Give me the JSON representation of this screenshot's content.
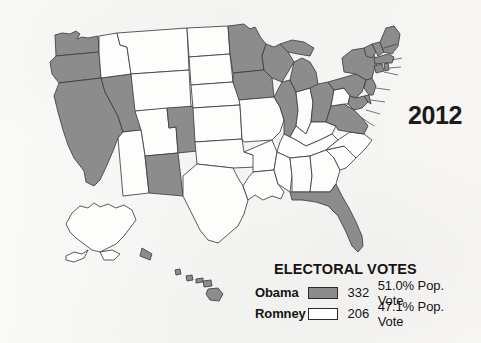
{
  "year_label": "2012",
  "legend": {
    "title": "ELECTORAL VOTES",
    "rows": [
      {
        "candidate": "Obama",
        "electoral_votes": "332",
        "popular_vote": "51.0% Pop. Vote",
        "swatch_color": "#8c8c8c"
      },
      {
        "candidate": "Romney",
        "electoral_votes": "206",
        "popular_vote": "47.1% Pop. Vote",
        "swatch_color": "#ffffff"
      }
    ]
  },
  "map": {
    "title": "2012 United States presidential election results by state",
    "colors": {
      "obama_fill": "#8c8c8c",
      "romney_fill": "#fdfdfc",
      "border": "#3d3d3d",
      "paper": "#f7f7f5"
    },
    "states": [
      {
        "code": "WA",
        "winner": "Obama"
      },
      {
        "code": "OR",
        "winner": "Obama"
      },
      {
        "code": "CA",
        "winner": "Obama"
      },
      {
        "code": "NV",
        "winner": "Obama"
      },
      {
        "code": "ID",
        "winner": "Romney"
      },
      {
        "code": "MT",
        "winner": "Romney"
      },
      {
        "code": "WY",
        "winner": "Romney"
      },
      {
        "code": "UT",
        "winner": "Romney"
      },
      {
        "code": "AZ",
        "winner": "Romney"
      },
      {
        "code": "CO",
        "winner": "Obama"
      },
      {
        "code": "NM",
        "winner": "Obama"
      },
      {
        "code": "ND",
        "winner": "Romney"
      },
      {
        "code": "SD",
        "winner": "Romney"
      },
      {
        "code": "NE",
        "winner": "Romney"
      },
      {
        "code": "KS",
        "winner": "Romney"
      },
      {
        "code": "OK",
        "winner": "Romney"
      },
      {
        "code": "TX",
        "winner": "Romney"
      },
      {
        "code": "MN",
        "winner": "Obama"
      },
      {
        "code": "IA",
        "winner": "Obama"
      },
      {
        "code": "MO",
        "winner": "Romney"
      },
      {
        "code": "AR",
        "winner": "Romney"
      },
      {
        "code": "LA",
        "winner": "Romney"
      },
      {
        "code": "WI",
        "winner": "Obama"
      },
      {
        "code": "IL",
        "winner": "Obama"
      },
      {
        "code": "MS",
        "winner": "Romney"
      },
      {
        "code": "AL",
        "winner": "Romney"
      },
      {
        "code": "TN",
        "winner": "Romney"
      },
      {
        "code": "KY",
        "winner": "Romney"
      },
      {
        "code": "IN",
        "winner": "Romney"
      },
      {
        "code": "MI",
        "winner": "Obama"
      },
      {
        "code": "OH",
        "winner": "Obama"
      },
      {
        "code": "WV",
        "winner": "Romney"
      },
      {
        "code": "GA",
        "winner": "Romney"
      },
      {
        "code": "FL",
        "winner": "Obama"
      },
      {
        "code": "SC",
        "winner": "Romney"
      },
      {
        "code": "NC",
        "winner": "Romney"
      },
      {
        "code": "VA",
        "winner": "Obama"
      },
      {
        "code": "MD",
        "winner": "Obama"
      },
      {
        "code": "DE",
        "winner": "Obama"
      },
      {
        "code": "DC",
        "winner": "Obama"
      },
      {
        "code": "PA",
        "winner": "Obama"
      },
      {
        "code": "NJ",
        "winner": "Obama"
      },
      {
        "code": "NY",
        "winner": "Obama"
      },
      {
        "code": "CT",
        "winner": "Obama"
      },
      {
        "code": "RI",
        "winner": "Obama"
      },
      {
        "code": "MA",
        "winner": "Obama"
      },
      {
        "code": "VT",
        "winner": "Obama"
      },
      {
        "code": "NH",
        "winner": "Obama"
      },
      {
        "code": "ME",
        "winner": "Obama"
      },
      {
        "code": "AK",
        "winner": "Romney"
      },
      {
        "code": "HI",
        "winner": "Obama"
      }
    ]
  }
}
